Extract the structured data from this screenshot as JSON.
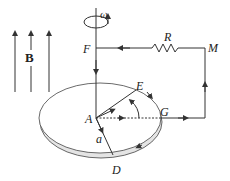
{
  "diagram": {
    "type": "physics-rotating-disk-homopolar-generator",
    "labels": {
      "field": "B",
      "omega": "ω",
      "F": "F",
      "R": "R",
      "M": "M",
      "E": "E",
      "A": "A",
      "G": "G",
      "a": "a",
      "D": "D"
    },
    "colors": {
      "line": "#333333",
      "disk_rim": "#dddddd",
      "background": "#ffffff"
    },
    "elements": [
      "three upward magnetic field arrows labeled B",
      "vertical rotation axis through F to disk center A with rotation arrow ω",
      "resistor R between F and M",
      "wire from M down to G on disk rim",
      "radius AE, radius AD labeled a, dashed radius AG",
      "curved arrow from AG to AE"
    ]
  }
}
